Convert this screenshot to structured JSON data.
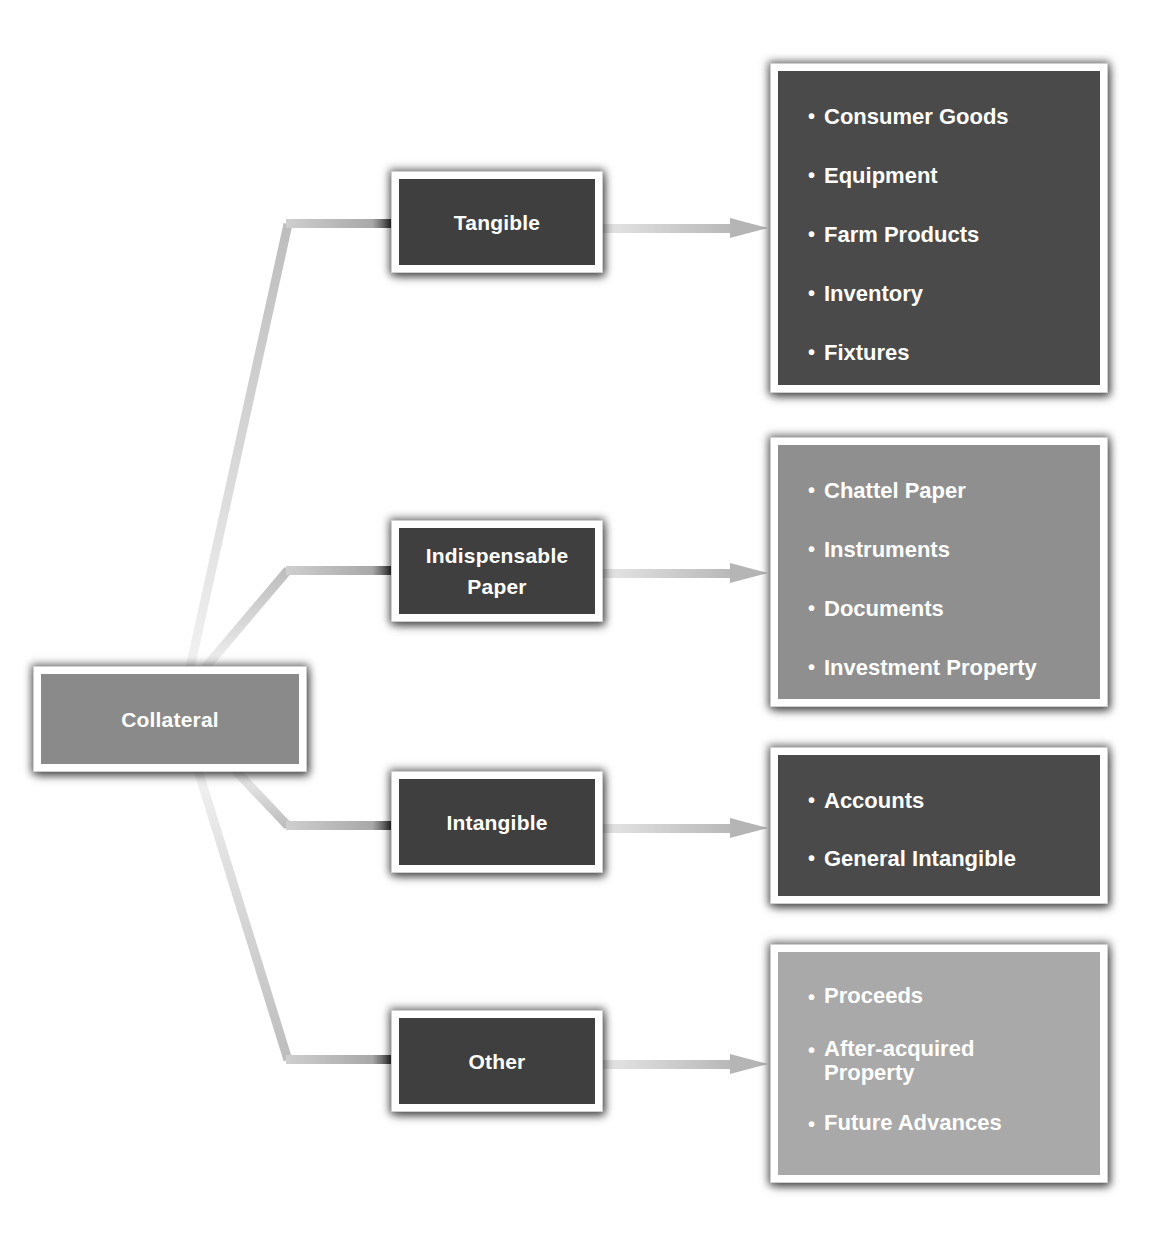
{
  "diagram": {
    "root": {
      "label": "Collateral",
      "color": "#8a8a8a"
    },
    "categories": [
      {
        "label": "Tangible",
        "color": "#3f3f3f",
        "items_color": "#4a4a4a",
        "items": [
          "Consumer Goods",
          "Equipment",
          "Farm Products",
          "Inventory",
          "Fixtures"
        ]
      },
      {
        "label": "Indispensable\nPaper",
        "color": "#3f3f3f",
        "items_color": "#8f8f8f",
        "items": [
          "Chattel Paper",
          "Instruments",
          "Documents",
          "Investment Property"
        ]
      },
      {
        "label": "Intangible",
        "color": "#3f3f3f",
        "items_color": "#4a4a4a",
        "items": [
          "Accounts",
          "General Intangible"
        ]
      },
      {
        "label": "Other",
        "color": "#3f3f3f",
        "items_color": "#a9a9a9",
        "items": [
          "Proceeds",
          "After-acquired\nProperty",
          "Future Advances"
        ]
      }
    ],
    "bullet_glyph": "•",
    "connector_color": "#c8c8c8",
    "arrow_color": "#bdbdbd"
  }
}
